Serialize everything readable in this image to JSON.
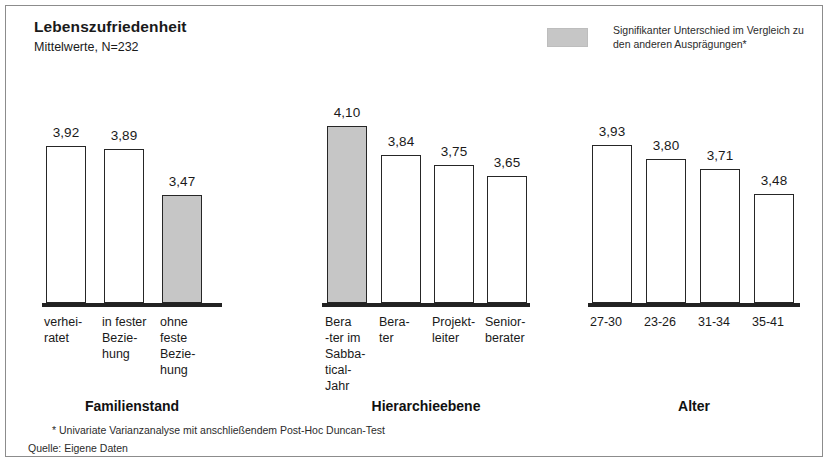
{
  "header": {
    "title": "Lebenszufriedenheit",
    "subtitle": "Mittelwerte, N=232"
  },
  "legend": {
    "swatch_color": "#c6c6c6",
    "text": "Signifikanter Unterschied im Vergleich zu den anderen Ausprägungen*"
  },
  "footer": {
    "footnote": "* Univariate Varianzanalyse mit anschließendem Post-Hoc Duncan-Test",
    "source": "Quelle:  Eigene Daten"
  },
  "chart_data": {
    "type": "bar",
    "title": "Lebenszufriedenheit",
    "subtitle": "Mittelwerte, N=232",
    "xlabel": "",
    "ylabel": "Mittelwert",
    "ylim": [
      3.2,
      4.2
    ],
    "grid": false,
    "axis_visible": false,
    "baseline_truncated": true,
    "legend_position": "top-right",
    "decimal_separator": ",",
    "groups": [
      {
        "name": "Familienstand",
        "categories": [
          "verhei-\nratet",
          "in fester\nBezie-\nhung",
          "ohne\nfeste\nBezie-\nhung"
        ],
        "values": [
          3.92,
          3.89,
          3.47
        ],
        "labels": [
          "3,92",
          "3,89",
          "3,47"
        ],
        "highlight": [
          false,
          false,
          true
        ]
      },
      {
        "name": "Hierarchieebene",
        "categories": [
          "Bera\n-ter im\nSabba-\ntical-\nJahr",
          "Bera-\nter",
          "Projekt-\nleiter",
          "Senior-\nberater"
        ],
        "values": [
          4.1,
          3.84,
          3.75,
          3.65
        ],
        "labels": [
          "4,10",
          "3,84",
          "3,75",
          "3,65"
        ],
        "highlight": [
          true,
          false,
          false,
          false
        ]
      },
      {
        "name": "Alter",
        "categories": [
          "27-30",
          "23-26",
          "31-34",
          "35-41"
        ],
        "values": [
          3.93,
          3.8,
          3.71,
          3.48
        ],
        "labels": [
          "3,93",
          "3,80",
          "3,71",
          "3,48"
        ],
        "highlight": [
          false,
          false,
          false,
          false
        ]
      }
    ]
  },
  "layout": {
    "baseline_y": 303,
    "px_per_unit": 110,
    "value_zero_y": 577,
    "bar_width": 40,
    "groups_geometry": [
      {
        "left": 42,
        "width": 180,
        "bar_x": [
          46,
          104,
          162
        ],
        "title_center": 132,
        "title_y": 398,
        "label_y": 314
      },
      {
        "left": 322,
        "width": 208,
        "bar_x": [
          327,
          381,
          434,
          487
        ],
        "title_center": 426,
        "title_y": 398,
        "label_y": 314
      },
      {
        "left": 588,
        "width": 212,
        "bar_x": [
          592,
          646,
          700,
          754
        ],
        "title_center": 694,
        "title_y": 398,
        "label_y": 314
      }
    ]
  }
}
